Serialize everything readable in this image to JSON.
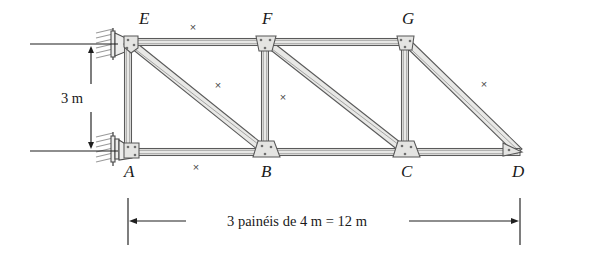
{
  "figure": {
    "type": "truss-diagram",
    "background_color": "#ffffff",
    "line_color": "#1f1f1f",
    "member_fill": "#e8e8e6"
  },
  "nodes": [
    {
      "id": "A",
      "label": "A",
      "x": 128,
      "y": 152,
      "label_x": 124,
      "label_y": 175,
      "chord": "bottom"
    },
    {
      "id": "B",
      "label": "B",
      "x": 265,
      "y": 152,
      "label_x": 261,
      "label_y": 175,
      "chord": "bottom"
    },
    {
      "id": "C",
      "label": "C",
      "x": 405,
      "y": 152,
      "label_x": 401,
      "label_y": 175,
      "chord": "bottom"
    },
    {
      "id": "D",
      "label": "D",
      "x": 518,
      "y": 152,
      "label_x": 512,
      "label_y": 175,
      "chord": "bottom"
    },
    {
      "id": "E",
      "label": "E",
      "x": 128,
      "y": 42,
      "label_x": 139,
      "label_y": 24,
      "chord": "top"
    },
    {
      "id": "F",
      "label": "F",
      "x": 265,
      "y": 42,
      "label_x": 262,
      "label_y": 24,
      "chord": "top"
    },
    {
      "id": "G",
      "label": "G",
      "x": 405,
      "y": 42,
      "label_x": 402,
      "label_y": 24,
      "chord": "top"
    }
  ],
  "members": [
    {
      "name": "EF",
      "from": "E",
      "to": "F",
      "kind": "top-chord"
    },
    {
      "name": "FG",
      "from": "F",
      "to": "G",
      "kind": "top-chord"
    },
    {
      "name": "GD",
      "from": "G",
      "to": "D",
      "kind": "top-chord-diagonal"
    },
    {
      "name": "AB",
      "from": "A",
      "to": "B",
      "kind": "bottom-chord"
    },
    {
      "name": "BC",
      "from": "B",
      "to": "C",
      "kind": "bottom-chord"
    },
    {
      "name": "CD",
      "from": "C",
      "to": "D",
      "kind": "bottom-chord"
    },
    {
      "name": "EA",
      "from": "E",
      "to": "A",
      "kind": "vertical"
    },
    {
      "name": "FB",
      "from": "F",
      "to": "B",
      "kind": "vertical"
    },
    {
      "name": "GC",
      "from": "G",
      "to": "C",
      "kind": "vertical"
    },
    {
      "name": "EB",
      "from": "E",
      "to": "B",
      "kind": "diagonal"
    },
    {
      "name": "FC",
      "from": "F",
      "to": "C",
      "kind": "diagonal"
    }
  ],
  "x_markers": [
    {
      "on_member": "EF",
      "x": 193,
      "y": 31
    },
    {
      "on_member": "EB",
      "x": 218,
      "y": 89
    },
    {
      "on_member": "FB",
      "x": 283,
      "y": 101
    },
    {
      "on_member": "AB",
      "x": 196,
      "y": 168
    },
    {
      "on_member": "GD",
      "x": 484,
      "y": 88
    }
  ],
  "marker_glyph": "×",
  "supports": [
    {
      "id": "support-E",
      "node": "E",
      "type": "pin-on-wall",
      "x": 128,
      "y": 42
    },
    {
      "id": "support-A",
      "node": "A",
      "type": "pin-on-wall",
      "x": 128,
      "y": 152
    }
  ],
  "dimensions": {
    "vertical": {
      "name": "height-dimension",
      "text": "3 m",
      "value": 3,
      "unit": "m",
      "text_x": 54,
      "text_y": 103,
      "line_x": 91,
      "top_y": 44,
      "bottom_y": 151,
      "ext_top": {
        "x1": 30,
        "x2": 118,
        "y": 44
      },
      "ext_bottom": {
        "x1": 30,
        "x2": 118,
        "y": 151
      }
    },
    "horizontal": {
      "name": "span-dimension",
      "text": "3 painéis de 4 m = 12 m",
      "panels": 3,
      "panel_length": 4,
      "total_length": 12,
      "unit": "m",
      "text_x": 297,
      "text_y": 226,
      "line_y": 221,
      "left_x": 128,
      "right_x": 520,
      "ext_left": {
        "x": 128,
        "y1": 198,
        "y2": 245
      },
      "ext_right": {
        "x": 520,
        "y1": 198,
        "y2": 245
      }
    }
  }
}
